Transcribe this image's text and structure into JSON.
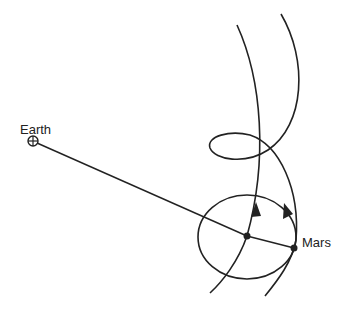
{
  "diagram": {
    "type": "epicycle",
    "labels": {
      "earth": "Earth",
      "mars": "Mars"
    },
    "colors": {
      "stroke": "#222222",
      "background": "#ffffff"
    }
  }
}
